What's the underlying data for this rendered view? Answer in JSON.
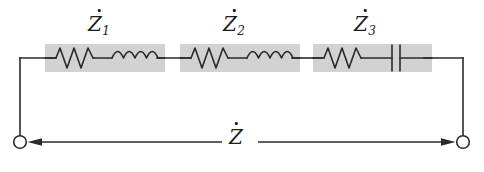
{
  "figure": {
    "kind": "circuit-diagram",
    "background_color": "#ffffff",
    "wire_color": "#2a2a2a",
    "block_fill_color": "#d2d2d2",
    "block_edge_color": "#d2d2d2",
    "label_color": "#1d1d1d",
    "terminal_fill_color": "#ffffff"
  },
  "labels": {
    "z1": {
      "symbol": "Z",
      "subscript": "1",
      "overdot": true,
      "text": "Ż₁"
    },
    "z2": {
      "symbol": "Z",
      "subscript": "2",
      "overdot": true,
      "text": "Ż₂"
    },
    "z3": {
      "symbol": "Z",
      "subscript": "3",
      "overdot": true,
      "text": "Ż₃"
    },
    "z_total": {
      "symbol": "Z",
      "subscript": "",
      "overdot": true,
      "text": "Ż"
    }
  },
  "blocks": [
    {
      "name": "impedance-block-1",
      "label_key": "z1",
      "elements": [
        "resistor",
        "inductor"
      ],
      "box": {
        "x": 45,
        "y": 44,
        "w": 120,
        "h": 28
      },
      "label_pos": {
        "x": 88,
        "y": 14
      }
    },
    {
      "name": "impedance-block-2",
      "label_key": "z2",
      "elements": [
        "resistor",
        "inductor"
      ],
      "box": {
        "x": 180,
        "y": 44,
        "w": 120,
        "h": 28
      },
      "label_pos": {
        "x": 223,
        "y": 14
      }
    },
    {
      "name": "impedance-block-3",
      "label_key": "z3",
      "elements": [
        "resistor",
        "capacitor"
      ],
      "box": {
        "x": 313,
        "y": 44,
        "w": 119,
        "h": 28
      },
      "label_pos": {
        "x": 354,
        "y": 14
      }
    }
  ],
  "geometry": {
    "top_wire_y": 58,
    "bottom_wire_y": 142,
    "left_wire_x": 20,
    "right_wire_x": 463,
    "terminal_radius": 6.5,
    "total_label_pos": {
      "x": 227,
      "y": 126
    },
    "measure_gap": {
      "from": 222,
      "to": 258
    }
  },
  "terminals": [
    {
      "name": "terminal-left",
      "cx": 20,
      "cy": 142
    },
    {
      "name": "terminal-right",
      "cx": 463,
      "cy": 142
    }
  ]
}
